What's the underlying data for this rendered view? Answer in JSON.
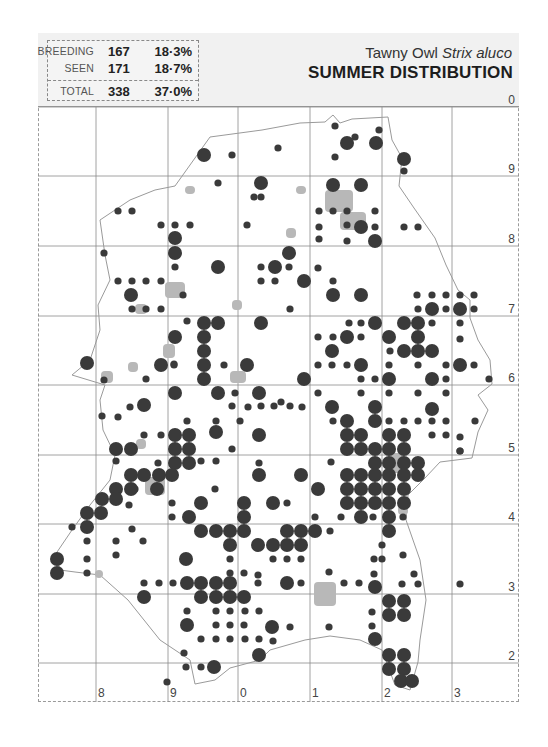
{
  "header": {
    "title_common": "Tawny Owl ",
    "title_scientific": "Strix aluco",
    "title_main": "SUMMER DISTRIBUTION"
  },
  "legend": {
    "rows": [
      {
        "label": "BREEDING",
        "count": "167",
        "percent": "18·3%"
      },
      {
        "label": "SEEN",
        "count": "171",
        "percent": "18·7%"
      },
      {
        "label": "TOTAL",
        "count": "338",
        "percent": "37·0%"
      }
    ]
  },
  "grid": {
    "x_lines": [
      96,
      168,
      238,
      310,
      382,
      452
    ],
    "y_lines": [
      107,
      176,
      246,
      316,
      385,
      455,
      524,
      594,
      663
    ],
    "right_labels": [
      {
        "text": "0",
        "y": 107
      },
      {
        "text": "9",
        "y": 176
      },
      {
        "text": "8",
        "y": 246
      },
      {
        "text": "7",
        "y": 316
      },
      {
        "text": "6",
        "y": 385
      },
      {
        "text": "5",
        "y": 455
      },
      {
        "text": "4",
        "y": 524
      },
      {
        "text": "3",
        "y": 594
      },
      {
        "text": "2",
        "y": 663
      }
    ],
    "bottom_labels": [
      {
        "text": "8",
        "x": 96
      },
      {
        "text": "9",
        "x": 168
      },
      {
        "text": "0",
        "x": 238
      },
      {
        "text": "1",
        "x": 310
      },
      {
        "text": "2",
        "x": 382
      },
      {
        "text": "3",
        "x": 452
      }
    ]
  },
  "colors": {
    "dot": "#3a3a3a",
    "urban": "#b8b8b8",
    "outline": "#9a9a9a",
    "grid": "#8a8a8a",
    "header_bg": "#f1f1f1"
  },
  "map_data": {
    "breeding": [
      [
        204,
        155
      ],
      [
        347,
        143
      ],
      [
        376,
        143
      ],
      [
        404,
        159
      ],
      [
        261,
        183
      ],
      [
        333,
        185
      ],
      [
        361,
        185
      ],
      [
        361,
        227
      ],
      [
        375,
        241
      ],
      [
        175,
        238
      ],
      [
        175,
        253
      ],
      [
        289,
        253
      ],
      [
        275,
        267
      ],
      [
        304,
        281
      ],
      [
        218,
        267
      ],
      [
        131,
        295
      ],
      [
        333,
        295
      ],
      [
        361,
        295
      ],
      [
        432,
        309
      ],
      [
        460,
        309
      ],
      [
        418,
        323
      ],
      [
        204,
        323
      ],
      [
        218,
        323
      ],
      [
        261,
        323
      ],
      [
        375,
        323
      ],
      [
        404,
        323
      ],
      [
        175,
        337
      ],
      [
        204,
        337
      ],
      [
        347,
        337
      ],
      [
        389,
        337
      ],
      [
        418,
        337
      ],
      [
        204,
        351
      ],
      [
        332,
        351
      ],
      [
        404,
        351
      ],
      [
        418,
        351
      ],
      [
        432,
        351
      ],
      [
        161,
        365
      ],
      [
        204,
        365
      ],
      [
        247,
        365
      ],
      [
        361,
        365
      ],
      [
        460,
        365
      ],
      [
        87,
        363
      ],
      [
        204,
        379
      ],
      [
        304,
        379
      ],
      [
        389,
        379
      ],
      [
        432,
        379
      ],
      [
        175,
        393
      ],
      [
        218,
        393
      ],
      [
        259,
        393
      ],
      [
        332,
        407
      ],
      [
        347,
        421
      ],
      [
        375,
        407
      ],
      [
        432,
        409
      ],
      [
        144,
        405
      ],
      [
        175,
        435
      ],
      [
        189,
        435
      ],
      [
        216,
        432
      ],
      [
        347,
        435
      ],
      [
        361,
        435
      ],
      [
        375,
        421
      ],
      [
        389,
        435
      ],
      [
        404,
        435
      ],
      [
        259,
        435
      ],
      [
        175,
        449
      ],
      [
        189,
        449
      ],
      [
        131,
        449
      ],
      [
        347,
        449
      ],
      [
        361,
        449
      ],
      [
        375,
        449
      ],
      [
        389,
        449
      ],
      [
        404,
        449
      ],
      [
        116,
        449
      ],
      [
        189,
        463
      ],
      [
        175,
        463
      ],
      [
        375,
        463
      ],
      [
        389,
        463
      ],
      [
        404,
        463
      ],
      [
        418,
        463
      ],
      [
        131,
        475
      ],
      [
        144,
        475
      ],
      [
        159,
        475
      ],
      [
        172,
        475
      ],
      [
        259,
        475
      ],
      [
        301,
        475
      ],
      [
        347,
        475
      ],
      [
        361,
        475
      ],
      [
        375,
        475
      ],
      [
        389,
        475
      ],
      [
        404,
        475
      ],
      [
        418,
        475
      ],
      [
        131,
        489
      ],
      [
        116,
        489
      ],
      [
        157,
        489
      ],
      [
        347,
        489
      ],
      [
        361,
        489
      ],
      [
        375,
        489
      ],
      [
        389,
        489
      ],
      [
        404,
        489
      ],
      [
        116,
        499
      ],
      [
        102,
        499
      ],
      [
        347,
        503
      ],
      [
        361,
        503
      ],
      [
        375,
        503
      ],
      [
        389,
        503
      ],
      [
        404,
        503
      ],
      [
        361,
        517
      ],
      [
        389,
        517
      ],
      [
        389,
        531
      ],
      [
        87,
        513
      ],
      [
        101,
        513
      ],
      [
        201,
        503
      ],
      [
        244,
        503
      ],
      [
        273,
        503
      ],
      [
        318,
        489
      ],
      [
        189,
        517
      ],
      [
        244,
        517
      ],
      [
        87,
        527
      ],
      [
        201,
        531
      ],
      [
        216,
        531
      ],
      [
        230,
        531
      ],
      [
        244,
        531
      ],
      [
        287,
        531
      ],
      [
        301,
        531
      ],
      [
        315,
        531
      ],
      [
        258,
        545
      ],
      [
        273,
        545
      ],
      [
        287,
        545
      ],
      [
        230,
        545
      ],
      [
        57,
        559
      ],
      [
        57,
        573
      ],
      [
        186,
        559
      ],
      [
        301,
        545
      ],
      [
        144,
        597
      ],
      [
        187,
        583
      ],
      [
        201,
        583
      ],
      [
        216,
        583
      ],
      [
        230,
        583
      ],
      [
        375,
        587
      ],
      [
        216,
        597
      ],
      [
        230,
        597
      ],
      [
        201,
        597
      ],
      [
        244,
        597
      ],
      [
        287,
        583
      ],
      [
        389,
        601
      ],
      [
        404,
        601
      ],
      [
        389,
        615
      ],
      [
        404,
        615
      ],
      [
        187,
        625
      ],
      [
        272,
        627
      ],
      [
        375,
        639
      ],
      [
        259,
        655
      ],
      [
        389,
        655
      ],
      [
        404,
        655
      ],
      [
        389,
        669
      ],
      [
        404,
        669
      ],
      [
        214,
        667
      ],
      [
        401,
        681
      ],
      [
        412,
        681
      ]
    ],
    "seen": [
      [
        335,
        126
      ],
      [
        379,
        130
      ],
      [
        355,
        137
      ],
      [
        278,
        148
      ],
      [
        232,
        155
      ],
      [
        335,
        157
      ],
      [
        404,
        171
      ],
      [
        218,
        183
      ],
      [
        254,
        197
      ],
      [
        261,
        197
      ],
      [
        319,
        211
      ],
      [
        333,
        211
      ],
      [
        347,
        211
      ],
      [
        375,
        211
      ],
      [
        347,
        225
      ],
      [
        319,
        227
      ],
      [
        404,
        227
      ],
      [
        418,
        227
      ],
      [
        375,
        227
      ],
      [
        319,
        239
      ],
      [
        347,
        241
      ],
      [
        118,
        211
      ],
      [
        132,
        211
      ],
      [
        175,
        225
      ],
      [
        190,
        225
      ],
      [
        161,
        225
      ],
      [
        247,
        225
      ],
      [
        104,
        253
      ],
      [
        175,
        267
      ],
      [
        261,
        267
      ],
      [
        289,
        267
      ],
      [
        318,
        268
      ],
      [
        261,
        281
      ],
      [
        275,
        281
      ],
      [
        118,
        281
      ],
      [
        132,
        281
      ],
      [
        146,
        281
      ],
      [
        161,
        281
      ],
      [
        132,
        309
      ],
      [
        146,
        309
      ],
      [
        161,
        309
      ],
      [
        333,
        281
      ],
      [
        417,
        295
      ],
      [
        432,
        295
      ],
      [
        446,
        295
      ],
      [
        460,
        295
      ],
      [
        474,
        295
      ],
      [
        418,
        309
      ],
      [
        446,
        309
      ],
      [
        474,
        309
      ],
      [
        183,
        295
      ],
      [
        187,
        321
      ],
      [
        261,
        321
      ],
      [
        290,
        309
      ],
      [
        349,
        323
      ],
      [
        361,
        323
      ],
      [
        432,
        323
      ],
      [
        460,
        323
      ],
      [
        460,
        339
      ],
      [
        333,
        337
      ],
      [
        361,
        337
      ],
      [
        174,
        364
      ],
      [
        318,
        337
      ],
      [
        390,
        351
      ],
      [
        318,
        365
      ],
      [
        332,
        365
      ],
      [
        347,
        365
      ],
      [
        389,
        365
      ],
      [
        418,
        365
      ],
      [
        446,
        365
      ],
      [
        474,
        365
      ],
      [
        489,
        379
      ],
      [
        146,
        379
      ],
      [
        174,
        365
      ],
      [
        224,
        365
      ],
      [
        235,
        393
      ],
      [
        104,
        380
      ],
      [
        102,
        416
      ],
      [
        118,
        417
      ],
      [
        130,
        407
      ],
      [
        361,
        379
      ],
      [
        375,
        379
      ],
      [
        446,
        379
      ],
      [
        446,
        393
      ],
      [
        318,
        393
      ],
      [
        389,
        393
      ],
      [
        418,
        393
      ],
      [
        432,
        409
      ],
      [
        333,
        421
      ],
      [
        361,
        393
      ],
      [
        232,
        406
      ],
      [
        261,
        406
      ],
      [
        281,
        402
      ],
      [
        240,
        421
      ],
      [
        432,
        421
      ],
      [
        446,
        421
      ],
      [
        475,
        421
      ],
      [
        460,
        437
      ],
      [
        460,
        451
      ],
      [
        232,
        449
      ],
      [
        216,
        421
      ],
      [
        248,
        407
      ],
      [
        274,
        406
      ],
      [
        290,
        406
      ],
      [
        302,
        407
      ],
      [
        389,
        421
      ],
      [
        404,
        421
      ],
      [
        418,
        421
      ],
      [
        432,
        435
      ],
      [
        446,
        435
      ],
      [
        460,
        451
      ],
      [
        259,
        463
      ],
      [
        331,
        462
      ],
      [
        216,
        461
      ],
      [
        201,
        461
      ],
      [
        187,
        421
      ],
      [
        144,
        435
      ],
      [
        161,
        435
      ],
      [
        158,
        463
      ],
      [
        116,
        461
      ],
      [
        215,
        489
      ],
      [
        129,
        505
      ],
      [
        72,
        527
      ],
      [
        87,
        541
      ],
      [
        87,
        559
      ],
      [
        87,
        573
      ],
      [
        116,
        541
      ],
      [
        132,
        529
      ],
      [
        116,
        555
      ],
      [
        143,
        541
      ],
      [
        135,
        489
      ],
      [
        172,
        503
      ],
      [
        172,
        517
      ],
      [
        287,
        503
      ],
      [
        344,
        503
      ],
      [
        361,
        517
      ],
      [
        403,
        517
      ],
      [
        230,
        559
      ],
      [
        230,
        573
      ],
      [
        244,
        573
      ],
      [
        273,
        559
      ],
      [
        287,
        559
      ],
      [
        301,
        559
      ],
      [
        315,
        517
      ],
      [
        341,
        517
      ],
      [
        373,
        517
      ],
      [
        382,
        545
      ],
      [
        382,
        559
      ],
      [
        374,
        574
      ],
      [
        414,
        574
      ],
      [
        258,
        575
      ],
      [
        159,
        583
      ],
      [
        173,
        583
      ],
      [
        144,
        583
      ],
      [
        258,
        583
      ],
      [
        301,
        583
      ],
      [
        344,
        583
      ],
      [
        359,
        583
      ],
      [
        374,
        559
      ],
      [
        329,
        572
      ],
      [
        403,
        555
      ],
      [
        330,
        531
      ],
      [
        216,
        611
      ],
      [
        187,
        611
      ],
      [
        230,
        611
      ],
      [
        245,
        611
      ],
      [
        259,
        611
      ],
      [
        216,
        625
      ],
      [
        230,
        625
      ],
      [
        244,
        625
      ],
      [
        230,
        639
      ],
      [
        245,
        639
      ],
      [
        259,
        639
      ],
      [
        273,
        641
      ],
      [
        216,
        639
      ],
      [
        201,
        639
      ],
      [
        184,
        653
      ],
      [
        186,
        667
      ],
      [
        201,
        667
      ],
      [
        167,
        682
      ],
      [
        372,
        612
      ],
      [
        372,
        626
      ],
      [
        329,
        627
      ],
      [
        290,
        627
      ],
      [
        402,
        584
      ],
      [
        418,
        584
      ],
      [
        460,
        584
      ]
    ],
    "urban": [
      [
        325,
        190,
        28,
        22
      ],
      [
        340,
        212,
        26,
        18
      ],
      [
        185,
        186,
        10,
        8
      ],
      [
        296,
        186,
        10,
        8
      ],
      [
        165,
        282,
        20,
        16
      ],
      [
        135,
        304,
        12,
        10
      ],
      [
        163,
        344,
        12,
        14
      ],
      [
        232,
        300,
        10,
        10
      ],
      [
        101,
        371,
        12,
        12
      ],
      [
        128,
        362,
        10,
        10
      ],
      [
        230,
        371,
        16,
        12
      ],
      [
        136,
        439,
        10,
        10
      ],
      [
        145,
        477,
        20,
        18
      ],
      [
        314,
        582,
        22,
        24
      ],
      [
        388,
        453,
        16,
        20
      ],
      [
        95,
        570,
        8,
        8
      ],
      [
        398,
        505,
        10,
        10
      ],
      [
        286,
        228,
        10,
        10
      ]
    ]
  }
}
